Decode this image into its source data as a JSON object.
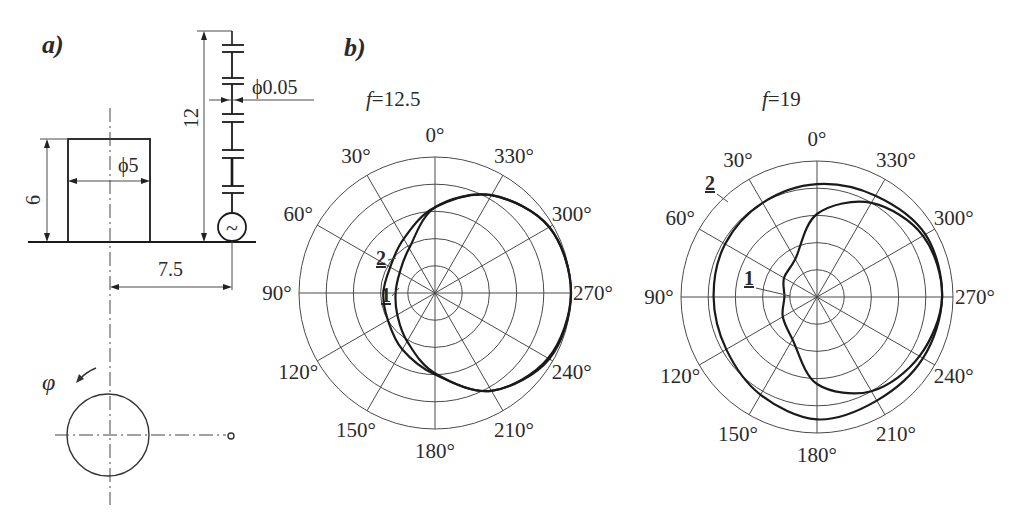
{
  "panel_a": {
    "label": "a)",
    "dim_height": "6",
    "dim_diameter": "ϕ5",
    "dim_wire_height": "12",
    "dim_wire_diameter": "ϕ0.05",
    "dim_offset": "7.5",
    "angle_symbol": "φ",
    "source_icon": "~"
  },
  "panel_b": {
    "label": "b)"
  },
  "chart_data": [
    {
      "type": "polar",
      "title": "f=12.5",
      "title_prefix": "f",
      "title_value": "=12.5",
      "angle_direction": "counterclockwise",
      "zero_location": "top",
      "angle_ticks": [
        "0°",
        "30°",
        "60°",
        "90°",
        "120°",
        "150°",
        "180°",
        "210°",
        "240°",
        "270°",
        "300°",
        "330°"
      ],
      "rings": 5,
      "r_range": [
        0,
        1
      ],
      "series": [
        {
          "name": "1",
          "angles": [
            0,
            30,
            60,
            90,
            120,
            150,
            180,
            210,
            240,
            270,
            300,
            330
          ],
          "values": [
            0.63,
            0.38,
            0.3,
            0.29,
            0.32,
            0.41,
            0.59,
            0.83,
            0.96,
            1.0,
            0.97,
            0.83
          ]
        },
        {
          "name": "2",
          "angles": [
            0,
            30,
            60,
            90,
            120,
            150,
            180,
            210,
            240,
            270,
            300,
            330
          ],
          "values": [
            0.63,
            0.46,
            0.38,
            0.38,
            0.4,
            0.48,
            0.6,
            0.83,
            0.97,
            1.0,
            0.97,
            0.83
          ]
        }
      ]
    },
    {
      "type": "polar",
      "title": "f=19",
      "title_prefix": "f",
      "title_value": "=19",
      "angle_direction": "counterclockwise",
      "zero_location": "top",
      "angle_ticks": [
        "0°",
        "30°",
        "60°",
        "90°",
        "120°",
        "150°",
        "180°",
        "210°",
        "240°",
        "270°",
        "300°",
        "330°"
      ],
      "rings": 5,
      "r_range": [
        0,
        1
      ],
      "series": [
        {
          "name": "1",
          "angles": [
            0,
            30,
            60,
            90,
            120,
            150,
            180,
            210,
            240,
            270,
            300,
            330
          ],
          "values": [
            0.61,
            0.32,
            0.28,
            0.24,
            0.29,
            0.36,
            0.64,
            0.8,
            0.87,
            0.92,
            0.9,
            0.8
          ]
        },
        {
          "name": "2",
          "angles": [
            0,
            30,
            60,
            90,
            120,
            150,
            180,
            210,
            240,
            270,
            300,
            330
          ],
          "values": [
            0.83,
            0.8,
            0.78,
            0.76,
            0.77,
            0.83,
            0.9,
            0.88,
            0.9,
            0.92,
            0.92,
            0.86
          ]
        }
      ]
    }
  ]
}
